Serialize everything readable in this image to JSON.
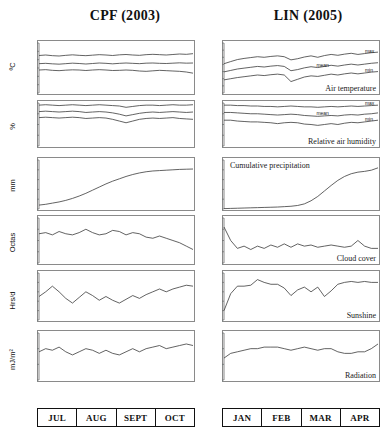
{
  "figure": {
    "columns": [
      {
        "key": "cpf",
        "title": "CPF (2003)"
      },
      {
        "key": "lin",
        "title": "LIN (2005)"
      }
    ],
    "row_units": [
      "ºC",
      "%",
      "mm",
      "Octas",
      "Hrs/d",
      "mJ/m²"
    ],
    "month_axis": {
      "cpf": [
        "JUL",
        "AUG",
        "SEPT",
        "OCT"
      ],
      "lin": [
        "JAN",
        "FEB",
        "MAR",
        "APR"
      ]
    },
    "panel_labels": {
      "air_temperature": "Air temperature",
      "relative_air_humidity": "Relative air humidity",
      "cumulative_precipitation": "Cumulative precipitation",
      "cloud_cover": "Cloud cover",
      "sunshine": "Sunshine",
      "radiation": "Radiation"
    },
    "series_labels": {
      "max": "max",
      "mean": "mean",
      "min": "min"
    },
    "line_color": "#3b3b3b",
    "frame_color": "#8a8a8a"
  },
  "chart_data": [
    {
      "id": "cpf-air-temperature",
      "type": "line",
      "title": "Air temperature",
      "station": "CPF (2003)",
      "ylabel": "ºC",
      "ylim": [
        10,
        40
      ],
      "yticks": [
        10,
        15,
        20,
        25,
        30,
        35,
        40
      ],
      "grid": false,
      "xlabel": "",
      "xticklabels": [
        "JUL",
        "AUG",
        "SEPT",
        "OCT"
      ],
      "x": [
        0,
        1,
        2,
        3,
        4,
        5,
        6,
        7,
        8,
        9,
        10,
        11,
        12,
        13,
        14,
        15,
        16,
        17,
        18,
        19,
        20,
        21,
        22,
        23
      ],
      "series": [
        {
          "name": "max",
          "values": [
            32.5,
            32.8,
            32.4,
            32.2,
            32.6,
            32.9,
            32.6,
            32.4,
            32.7,
            33.0,
            32.8,
            32.5,
            32.9,
            33.1,
            32.8,
            32.6,
            33.0,
            33.2,
            33.0,
            32.8,
            33.1,
            33.4,
            33.2,
            33.6
          ]
        },
        {
          "name": "mean",
          "values": [
            27.6,
            27.8,
            27.5,
            27.3,
            27.6,
            27.9,
            27.7,
            27.4,
            27.7,
            28.0,
            27.8,
            27.5,
            27.8,
            28.0,
            27.8,
            27.6,
            27.9,
            28.0,
            27.8,
            27.7,
            27.9,
            28.1,
            27.9,
            28.0
          ]
        },
        {
          "name": "min",
          "values": [
            23.8,
            24.0,
            23.6,
            23.4,
            23.7,
            23.9,
            23.8,
            23.5,
            23.8,
            24.0,
            23.8,
            23.5,
            23.6,
            23.8,
            23.6,
            23.2,
            23.0,
            23.3,
            23.6,
            23.4,
            23.2,
            23.0,
            22.6,
            21.9
          ]
        }
      ]
    },
    {
      "id": "lin-air-temperature",
      "type": "line",
      "title": "Air temperature",
      "station": "LIN (2005)",
      "ylabel": "ºC",
      "ylim": [
        5,
        40
      ],
      "yticks": [
        5,
        10,
        15,
        20,
        25,
        30,
        35,
        40
      ],
      "grid": false,
      "xticklabels": [
        "JAN",
        "FEB",
        "MAR",
        "APR"
      ],
      "x": [
        0,
        1,
        2,
        3,
        4,
        5,
        6,
        7,
        8,
        9,
        10,
        11,
        12,
        13,
        14,
        15,
        16,
        17,
        18,
        19,
        20,
        21,
        22,
        23
      ],
      "series": [
        {
          "name": "max",
          "values": [
            25.5,
            27.0,
            28.4,
            29.2,
            29.8,
            30.4,
            30.0,
            30.6,
            31.0,
            30.4,
            28.2,
            29.0,
            30.2,
            31.0,
            30.0,
            31.2,
            32.0,
            31.4,
            32.2,
            32.8,
            32.0,
            32.6,
            33.2,
            33.6
          ]
        },
        {
          "name": "mean",
          "values": [
            19.8,
            20.8,
            21.8,
            22.4,
            23.0,
            23.6,
            23.2,
            23.8,
            24.2,
            23.6,
            20.6,
            21.4,
            22.6,
            23.4,
            22.8,
            23.6,
            24.4,
            23.8,
            24.6,
            25.2,
            24.6,
            25.2,
            25.8,
            26.2
          ]
        },
        {
          "name": "min",
          "values": [
            14.2,
            15.0,
            15.8,
            16.4,
            17.0,
            17.6,
            17.2,
            17.8,
            18.2,
            17.6,
            13.0,
            14.6,
            16.2,
            17.0,
            16.6,
            17.4,
            18.2,
            17.6,
            18.4,
            19.0,
            18.4,
            19.0,
            19.6,
            20.0
          ]
        }
      ]
    },
    {
      "id": "cpf-relative-humidity",
      "type": "line",
      "title": "Relative air humidity",
      "station": "CPF (2003)",
      "ylabel": "%",
      "ylim": [
        0,
        100
      ],
      "yticks": [
        0,
        25,
        50,
        75,
        100
      ],
      "grid": false,
      "x": [
        0,
        1,
        2,
        3,
        4,
        5,
        6,
        7,
        8,
        9,
        10,
        11,
        12,
        13,
        14,
        15,
        16,
        17,
        18,
        19,
        20,
        21,
        22,
        23
      ],
      "series": [
        {
          "name": "max",
          "values": [
            95,
            96,
            95,
            94,
            95,
            96,
            95,
            94,
            95,
            96,
            95,
            94,
            93,
            90,
            92,
            94,
            95,
            95,
            94,
            95,
            96,
            95,
            95,
            96
          ]
        },
        {
          "name": "mean",
          "values": [
            80,
            81,
            80,
            79,
            80,
            81,
            80,
            78,
            79,
            80,
            79,
            77,
            74,
            70,
            73,
            76,
            78,
            79,
            78,
            79,
            80,
            79,
            78,
            79
          ]
        },
        {
          "name": "min",
          "values": [
            66,
            67,
            66,
            65,
            66,
            67,
            66,
            64,
            65,
            66,
            65,
            62,
            58,
            54,
            58,
            62,
            64,
            65,
            64,
            65,
            66,
            64,
            63,
            62
          ]
        }
      ]
    },
    {
      "id": "lin-relative-humidity",
      "type": "line",
      "title": "Relative air humidity",
      "station": "LIN (2005)",
      "ylabel": "%",
      "ylim": [
        0,
        100
      ],
      "yticks": [
        0,
        25,
        50,
        75,
        100
      ],
      "grid": false,
      "x": [
        0,
        1,
        2,
        3,
        4,
        5,
        6,
        7,
        8,
        9,
        10,
        11,
        12,
        13,
        14,
        15,
        16,
        17,
        18,
        19,
        20,
        21,
        22,
        23
      ],
      "series": [
        {
          "name": "max",
          "values": [
            95,
            95,
            94,
            94,
            93,
            93,
            92,
            92,
            91,
            92,
            93,
            92,
            91,
            91,
            90,
            91,
            92,
            91,
            92,
            93,
            92,
            93,
            94,
            95
          ]
        },
        {
          "name": "mean",
          "values": [
            78,
            78,
            77,
            76,
            75,
            75,
            74,
            73,
            72,
            73,
            74,
            73,
            71,
            70,
            69,
            70,
            71,
            70,
            72,
            73,
            72,
            74,
            75,
            77
          ]
        },
        {
          "name": "min",
          "values": [
            60,
            60,
            58,
            57,
            56,
            56,
            55,
            54,
            52,
            54,
            55,
            54,
            51,
            50,
            48,
            50,
            52,
            50,
            53,
            55,
            54,
            56,
            58,
            60
          ]
        }
      ]
    },
    {
      "id": "cpf-cumulative-precipitation",
      "type": "line",
      "title": "Cumulative precipitation",
      "station": "CPF (2003)",
      "ylabel": "mm",
      "ylim": [
        0,
        250
      ],
      "yticks": [
        0,
        50,
        100,
        150,
        200,
        250
      ],
      "grid": false,
      "x": [
        0,
        1,
        2,
        3,
        4,
        5,
        6,
        7,
        8,
        9,
        10,
        11,
        12,
        13,
        14,
        15,
        16,
        17,
        18,
        19,
        20,
        21,
        22,
        23
      ],
      "series": [
        {
          "name": "cumulative",
          "values": [
            20,
            24,
            30,
            36,
            44,
            54,
            66,
            80,
            96,
            112,
            128,
            142,
            154,
            166,
            176,
            184,
            190,
            194,
            196,
            198,
            200,
            202,
            203,
            204
          ]
        }
      ]
    },
    {
      "id": "lin-cumulative-precipitation",
      "type": "line",
      "title": "Cumulative precipitation",
      "station": "LIN (2005)",
      "ylabel": "mm",
      "ylim": [
        0,
        250
      ],
      "yticks": [
        0,
        50,
        100,
        150,
        200,
        250
      ],
      "grid": false,
      "x": [
        0,
        1,
        2,
        3,
        4,
        5,
        6,
        7,
        8,
        9,
        10,
        11,
        12,
        13,
        14,
        15,
        16,
        17,
        18,
        19,
        20,
        21,
        22,
        23
      ],
      "series": [
        {
          "name": "cumulative",
          "values": [
            2,
            3,
            4,
            5,
            6,
            7,
            8,
            9,
            10,
            12,
            14,
            18,
            26,
            42,
            64,
            92,
            120,
            146,
            166,
            180,
            188,
            192,
            198,
            210
          ]
        }
      ]
    },
    {
      "id": "cpf-cloud-cover",
      "type": "line",
      "title": "Cloud cover",
      "station": "CPF (2003)",
      "ylabel": "Octas",
      "ylim": [
        0,
        8
      ],
      "yticks": [
        0,
        2,
        4,
        6,
        8
      ],
      "grid": false,
      "x": [
        0,
        1,
        2,
        3,
        4,
        5,
        6,
        7,
        8,
        9,
        10,
        11,
        12,
        13,
        14,
        15,
        16,
        17,
        18,
        19,
        20,
        21,
        22,
        23
      ],
      "series": [
        {
          "name": "cloud",
          "values": [
            5.2,
            5.4,
            5.0,
            5.6,
            5.2,
            5.0,
            5.4,
            6.0,
            5.4,
            5.0,
            5.2,
            5.8,
            5.6,
            5.0,
            5.4,
            5.2,
            4.6,
            4.4,
            4.8,
            4.4,
            4.0,
            3.6,
            3.0,
            2.4
          ]
        }
      ]
    },
    {
      "id": "lin-cloud-cover",
      "type": "line",
      "title": "Cloud cover",
      "station": "LIN (2005)",
      "ylabel": "Octas",
      "ylim": [
        0,
        8
      ],
      "yticks": [
        0,
        2,
        4,
        6,
        8
      ],
      "grid": false,
      "x": [
        0,
        1,
        2,
        3,
        4,
        5,
        6,
        7,
        8,
        9,
        10,
        11,
        12,
        13,
        14,
        15,
        16,
        17,
        18,
        19,
        20,
        21,
        22,
        23
      ],
      "series": [
        {
          "name": "cloud",
          "values": [
            6.4,
            4.0,
            2.6,
            3.0,
            2.4,
            3.0,
            2.6,
            3.2,
            2.8,
            3.4,
            2.8,
            3.4,
            3.0,
            3.2,
            2.8,
            3.0,
            3.2,
            3.0,
            2.8,
            3.0,
            4.0,
            3.0,
            2.6,
            2.6
          ]
        }
      ]
    },
    {
      "id": "cpf-sunshine",
      "type": "line",
      "title": "Sunshine",
      "station": "CPF (2003)",
      "ylabel": "Hrs/d",
      "ylim": [
        0,
        10
      ],
      "yticks": [
        0,
        2,
        4,
        6,
        8,
        10
      ],
      "grid": false,
      "x": [
        0,
        1,
        2,
        3,
        4,
        5,
        6,
        7,
        8,
        9,
        10,
        11,
        12,
        13,
        14,
        15,
        16,
        17,
        18,
        19,
        20,
        21,
        22,
        23
      ],
      "series": [
        {
          "name": "sunshine",
          "values": [
            5.0,
            6.0,
            7.2,
            6.0,
            4.6,
            3.6,
            4.8,
            6.0,
            5.2,
            4.2,
            5.0,
            4.2,
            3.6,
            4.4,
            5.2,
            4.6,
            5.4,
            6.0,
            6.6,
            6.0,
            6.6,
            7.0,
            7.4,
            7.2
          ]
        }
      ]
    },
    {
      "id": "lin-sunshine",
      "type": "line",
      "title": "Sunshine",
      "station": "LIN (2005)",
      "ylabel": "Hrs/d",
      "ylim": [
        0,
        10
      ],
      "yticks": [
        0,
        2,
        4,
        6,
        8,
        10
      ],
      "grid": false,
      "x": [
        0,
        1,
        2,
        3,
        4,
        5,
        6,
        7,
        8,
        9,
        10,
        11,
        12,
        13,
        14,
        15,
        16,
        17,
        18,
        19,
        20,
        21,
        22,
        23
      ],
      "series": [
        {
          "name": "sunshine",
          "values": [
            2.0,
            5.6,
            7.2,
            7.2,
            7.4,
            8.6,
            8.0,
            7.6,
            7.6,
            6.8,
            5.2,
            6.4,
            7.0,
            6.0,
            7.0,
            5.0,
            6.2,
            7.6,
            8.0,
            8.2,
            8.0,
            8.2,
            8.0,
            8.0
          ]
        }
      ]
    },
    {
      "id": "cpf-radiation",
      "type": "line",
      "title": "Radiation",
      "station": "CPF (2003)",
      "ylabel": "mJ/m²",
      "ylim": [
        0,
        30
      ],
      "yticks": [
        0,
        10,
        20,
        30
      ],
      "grid": false,
      "x": [
        0,
        1,
        2,
        3,
        4,
        5,
        6,
        7,
        8,
        9,
        10,
        11,
        12,
        13,
        14,
        15,
        16,
        17,
        18,
        19,
        20,
        21,
        22,
        23
      ],
      "series": [
        {
          "name": "radiation",
          "values": [
            18,
            20,
            19,
            21,
            18,
            16,
            18,
            20,
            19,
            17,
            19,
            17,
            16,
            18,
            20,
            18,
            20,
            21,
            22,
            20,
            21,
            22,
            23,
            22
          ]
        }
      ]
    },
    {
      "id": "lin-radiation",
      "type": "line",
      "title": "Radiation",
      "station": "LIN (2005)",
      "ylabel": "mJ/m²",
      "ylim": [
        0,
        30
      ],
      "yticks": [
        0,
        10,
        20,
        30
      ],
      "grid": false,
      "x": [
        0,
        1,
        2,
        3,
        4,
        5,
        6,
        7,
        8,
        9,
        10,
        11,
        12,
        13,
        14,
        15,
        16,
        17,
        18,
        19,
        20,
        21,
        22,
        23
      ],
      "series": [
        {
          "name": "radiation",
          "values": [
            14,
            17,
            18,
            19,
            20,
            20,
            21,
            21,
            21,
            20,
            19,
            20,
            21,
            20,
            19,
            20,
            20,
            18,
            17,
            17,
            18,
            18,
            20,
            23
          ]
        }
      ]
    }
  ]
}
